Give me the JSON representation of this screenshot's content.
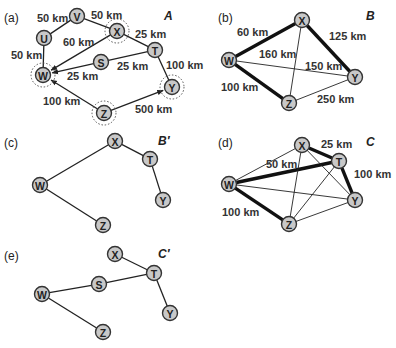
{
  "figure": {
    "panels": [
      {
        "id": "a",
        "label": "(a)",
        "title": "A",
        "nodes": [
          {
            "id": "V",
            "x": 77,
            "y": 16,
            "ring": false
          },
          {
            "id": "U",
            "x": 44,
            "y": 38,
            "ring": false
          },
          {
            "id": "X",
            "x": 117,
            "y": 31,
            "ring": true
          },
          {
            "id": "T",
            "x": 155,
            "y": 50,
            "ring": false
          },
          {
            "id": "S",
            "x": 101,
            "y": 62,
            "ring": false
          },
          {
            "id": "W",
            "x": 43,
            "y": 75,
            "ring": true
          },
          {
            "id": "Y",
            "x": 172,
            "y": 87,
            "ring": true
          },
          {
            "id": "Z",
            "x": 104,
            "y": 113,
            "ring": true
          }
        ],
        "edges": [
          {
            "from": "U",
            "to": "V",
            "label": "50 km",
            "style": "normal"
          },
          {
            "from": "V",
            "to": "X",
            "label": "50 km",
            "style": "normal"
          },
          {
            "from": "U",
            "to": "W",
            "label": "50 km",
            "style": "normal"
          },
          {
            "from": "X",
            "to": "W",
            "label": "60 km",
            "style": "arrow"
          },
          {
            "from": "X",
            "to": "T",
            "label": "25 km",
            "style": "normal"
          },
          {
            "from": "T",
            "to": "S",
            "label": "25 km",
            "style": "normal"
          },
          {
            "from": "S",
            "to": "W",
            "label": "25 km",
            "style": "arrow"
          },
          {
            "from": "T",
            "to": "Y",
            "label": "100 km",
            "style": "normal"
          },
          {
            "from": "Z",
            "to": "W",
            "label": "100 km",
            "style": "arrow"
          },
          {
            "from": "Z",
            "to": "Y",
            "label": "500 km",
            "style": "arrow"
          }
        ],
        "edge_labels": [
          {
            "text": "50 km",
            "x": 37,
            "y": 22
          },
          {
            "text": "50 km",
            "x": 91,
            "y": 19
          },
          {
            "text": "50 km",
            "x": 11,
            "y": 59
          },
          {
            "text": "60 km",
            "x": 63,
            "y": 46
          },
          {
            "text": "25 km",
            "x": 135,
            "y": 38
          },
          {
            "text": "25 km",
            "x": 117,
            "y": 70
          },
          {
            "text": "25 km",
            "x": 67,
            "y": 80
          },
          {
            "text": "100 km",
            "x": 166,
            "y": 69
          },
          {
            "text": "100 km",
            "x": 43,
            "y": 105
          },
          {
            "text": "500 km",
            "x": 135,
            "y": 113
          }
        ]
      },
      {
        "id": "b",
        "label": "(b)",
        "title": "B",
        "nodes": [
          {
            "id": "X",
            "x": 302,
            "y": 20
          },
          {
            "id": "W",
            "x": 229,
            "y": 60
          },
          {
            "id": "Y",
            "x": 355,
            "y": 77
          },
          {
            "id": "Z",
            "x": 289,
            "y": 103
          }
        ],
        "edges": [
          {
            "from": "W",
            "to": "X",
            "weight": "thick"
          },
          {
            "from": "X",
            "to": "Y",
            "weight": "thick"
          },
          {
            "from": "W",
            "to": "Z",
            "weight": "thick"
          },
          {
            "from": "X",
            "to": "Z",
            "weight": "thin"
          },
          {
            "from": "W",
            "to": "Y",
            "weight": "thin"
          },
          {
            "from": "Z",
            "to": "Y",
            "weight": "thin"
          }
        ],
        "edge_labels": [
          {
            "text": "60 km",
            "x": 237,
            "y": 36
          },
          {
            "text": "125 km",
            "x": 329,
            "y": 40
          },
          {
            "text": "160 km",
            "x": 259,
            "y": 58
          },
          {
            "text": "150 km",
            "x": 305,
            "y": 70
          },
          {
            "text": "100 km",
            "x": 221,
            "y": 91
          },
          {
            "text": "250 km",
            "x": 317,
            "y": 103
          }
        ]
      },
      {
        "id": "c",
        "label": "(c)",
        "title": "B′",
        "nodes": [
          {
            "id": "X",
            "x": 115,
            "y": 141
          },
          {
            "id": "T",
            "x": 150,
            "y": 159
          },
          {
            "id": "W",
            "x": 40,
            "y": 185
          },
          {
            "id": "Y",
            "x": 163,
            "y": 200
          },
          {
            "id": "Z",
            "x": 103,
            "y": 225
          }
        ],
        "edges": [
          {
            "from": "W",
            "to": "X"
          },
          {
            "from": "X",
            "to": "T"
          },
          {
            "from": "T",
            "to": "Y"
          },
          {
            "from": "W",
            "to": "Z"
          }
        ]
      },
      {
        "id": "d",
        "label": "(d)",
        "title": "C",
        "nodes": [
          {
            "id": "X",
            "x": 302,
            "y": 145
          },
          {
            "id": "T",
            "x": 339,
            "y": 161
          },
          {
            "id": "W",
            "x": 229,
            "y": 184
          },
          {
            "id": "Y",
            "x": 355,
            "y": 200
          },
          {
            "id": "Z",
            "x": 289,
            "y": 224
          }
        ],
        "edges": [
          {
            "from": "W",
            "to": "T",
            "weight": "thick"
          },
          {
            "from": "X",
            "to": "T",
            "weight": "thick"
          },
          {
            "from": "T",
            "to": "Y",
            "weight": "thick"
          },
          {
            "from": "W",
            "to": "Z",
            "weight": "thick"
          },
          {
            "from": "W",
            "to": "X",
            "weight": "thin"
          },
          {
            "from": "W",
            "to": "Y",
            "weight": "thin"
          },
          {
            "from": "X",
            "to": "Z",
            "weight": "thin"
          },
          {
            "from": "X",
            "to": "Y",
            "weight": "thin"
          },
          {
            "from": "T",
            "to": "Z",
            "weight": "thin"
          },
          {
            "from": "Z",
            "to": "Y",
            "weight": "thin"
          }
        ],
        "edge_labels": [
          {
            "text": "25 km",
            "x": 321,
            "y": 148
          },
          {
            "text": "50 km",
            "x": 266,
            "y": 168
          },
          {
            "text": "100 km",
            "x": 354,
            "y": 178
          },
          {
            "text": "100 km",
            "x": 222,
            "y": 216
          }
        ]
      },
      {
        "id": "e",
        "label": "(e)",
        "title": "C′",
        "nodes": [
          {
            "id": "X",
            "x": 115,
            "y": 254
          },
          {
            "id": "T",
            "x": 154,
            "y": 273
          },
          {
            "id": "S",
            "x": 99,
            "y": 284
          },
          {
            "id": "W",
            "x": 42,
            "y": 294
          },
          {
            "id": "Y",
            "x": 170,
            "y": 313
          },
          {
            "id": "Z",
            "x": 103,
            "y": 332
          }
        ],
        "edges": [
          {
            "from": "X",
            "to": "T"
          },
          {
            "from": "T",
            "to": "S"
          },
          {
            "from": "S",
            "to": "W"
          },
          {
            "from": "T",
            "to": "Y"
          },
          {
            "from": "W",
            "to": "Z"
          }
        ]
      }
    ]
  },
  "labels": {
    "a": {
      "panel": "(a)",
      "title": "A"
    },
    "b": {
      "panel": "(b)",
      "title": "B"
    },
    "c": {
      "panel": "(c)",
      "title": "B′"
    },
    "d": {
      "panel": "(d)",
      "title": "C"
    },
    "e": {
      "panel": "(e)",
      "title": "C′"
    }
  },
  "colors": {
    "node_fill": "#c8c8c8",
    "node_stroke": "#333333",
    "edge": "#222222",
    "background": "#ffffff"
  }
}
